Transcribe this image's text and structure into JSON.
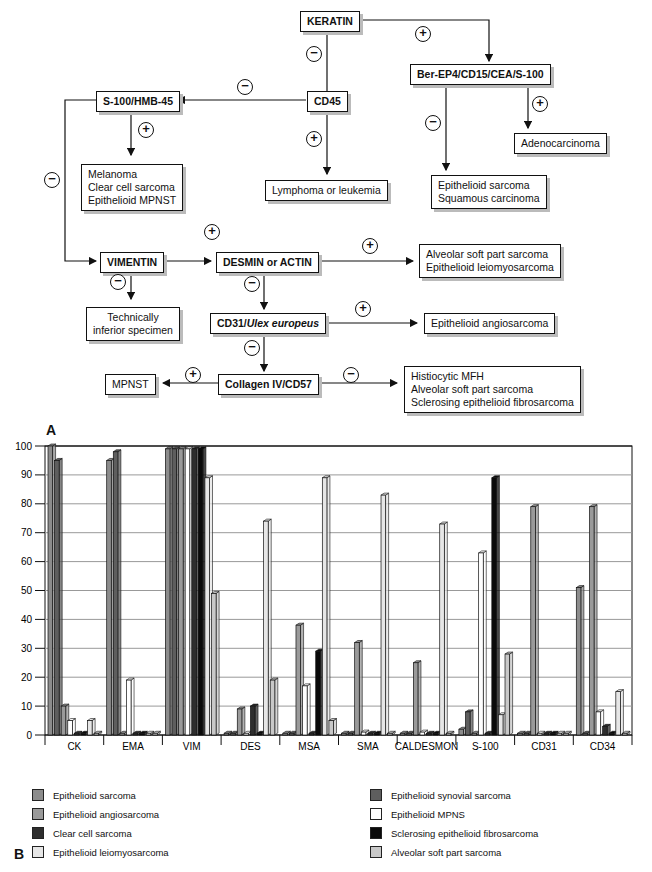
{
  "flowchart": {
    "nodes": {
      "keratin": "KERATIN",
      "ber": "Ber-EP4/CD15/CEA/S-100",
      "cd45": "CD45",
      "s100hmb": "S-100/HMB-45",
      "adeno": "Adenocarcinoma",
      "melanoma": [
        "Melanoma",
        "Clear cell sarcoma",
        "Epithelioid MPNST"
      ],
      "lymphoma": "Lymphoma or leukemia",
      "epsq": [
        "Epithelioid sarcoma",
        "Squamous carcinoma"
      ],
      "vimentin": "VIMENTIN",
      "desmin": "DESMIN or ACTIN",
      "alveolar": [
        "Alveolar soft part sarcoma",
        "Epithelioid leiomyosarcoma"
      ],
      "technically": [
        "Technically",
        "inferior specimen"
      ],
      "cd31_a": "CD31/",
      "cd31_b": "Ulex europeus",
      "angio": "Epithelioid angiosarcoma",
      "mpnst": "MPNST",
      "collagen": "Collagen IV/CD57",
      "histio": [
        "Histiocytic MFH",
        "Alveolar soft part sarcoma",
        "Sclerosing epithelioid fibrosarcoma"
      ]
    },
    "signs": {
      "plus": "+",
      "minus": "−"
    }
  },
  "panel_labels": {
    "a": "A",
    "b": "B"
  },
  "chart_data": {
    "type": "bar",
    "title": "",
    "xlabel": "",
    "ylabel": "",
    "ylim": [
      0,
      100
    ],
    "yticks": [
      0,
      10,
      20,
      30,
      40,
      50,
      60,
      70,
      80,
      90,
      100
    ],
    "grid": true,
    "legend_position": "bottom",
    "categories": [
      "CK",
      "EMA",
      "VIM",
      "DES",
      "MSA",
      "SMA",
      "CALDESMON",
      "S-100",
      "CD31",
      "CD34"
    ],
    "series": [
      {
        "name": "Epithelioid sarcoma",
        "color": "#8c8c8c",
        "values": [
          100,
          95,
          99,
          0,
          0,
          0,
          0,
          2,
          0,
          51
        ]
      },
      {
        "name": "Epithelioid synovial sarcoma",
        "color": "#5e5e5e",
        "values": [
          95,
          98,
          99,
          0,
          0,
          0,
          0,
          8,
          0,
          0
        ]
      },
      {
        "name": "Epithelioid angiosarcoma",
        "color": "#9a9a9a",
        "values": [
          10,
          0,
          99,
          9,
          38,
          32,
          25,
          0,
          79,
          79
        ]
      },
      {
        "name": "Epithelioid MPNS",
        "color": "#ffffff",
        "values": [
          5,
          19,
          99,
          0,
          17,
          1,
          1,
          63,
          0,
          8
        ]
      },
      {
        "name": "Clear cell sarcoma",
        "color": "#2e2e2e",
        "values": [
          0,
          0,
          99,
          10,
          0,
          0,
          0,
          0,
          0,
          3
        ]
      },
      {
        "name": "Sclerosing epithelioid fibrosarcoma",
        "color": "#0a0a0a",
        "values": [
          0,
          0,
          99,
          0,
          29,
          0,
          0,
          89,
          0,
          0
        ]
      },
      {
        "name": "Epithelioid leiomyosarcoma",
        "color": "#e6e6e6",
        "values": [
          5,
          0,
          89,
          74,
          89,
          83,
          73,
          7,
          0,
          15
        ]
      },
      {
        "name": "Alveolar soft part sarcoma",
        "color": "#c8c8c8",
        "values": [
          0,
          0,
          49,
          19,
          5,
          0,
          0,
          28,
          0,
          0
        ]
      }
    ]
  },
  "legend": {
    "left": [
      {
        "label": "Epithelioid sarcoma",
        "color": "#8c8c8c"
      },
      {
        "label": "Epithelioid angiosarcoma",
        "color": "#9a9a9a"
      },
      {
        "label": "Clear cell sarcoma",
        "color": "#2e2e2e"
      },
      {
        "label": "Epithelioid leiomyosarcoma",
        "color": "#e6e6e6"
      }
    ],
    "right": [
      {
        "label": "Epithelioid synovial sarcoma",
        "color": "#5e5e5e"
      },
      {
        "label": "Epithelioid MPNS",
        "color": "#ffffff"
      },
      {
        "label": "Sclerosing epithelioid fibrosarcoma",
        "color": "#0a0a0a"
      },
      {
        "label": "Alveolar soft part sarcoma",
        "color": "#c8c8c8"
      }
    ]
  }
}
